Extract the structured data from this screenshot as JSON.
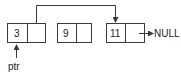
{
  "diagram": {
    "type": "linked-list",
    "nodes": [
      {
        "value": "3"
      },
      {
        "value": "9"
      },
      {
        "value": "11"
      }
    ],
    "null_label": "NULL",
    "pointer_label": "ptr",
    "colors": {
      "stroke": "#3a3a3a",
      "text": "#222222",
      "background": "#ffffff"
    }
  }
}
